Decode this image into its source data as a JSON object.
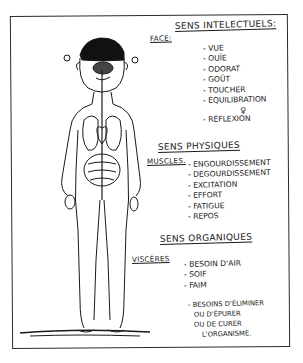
{
  "diagram": {
    "figure": "human-body-outline",
    "sections": [
      {
        "title": "Sens intelectuels:",
        "region_label": "Face:",
        "items": [
          "Vue",
          "Ouïe",
          "Odorat",
          "Goût",
          "Toucher",
          "Équilibration",
          "Réflexion"
        ],
        "symbol": "♀"
      },
      {
        "title": "Sens physiques",
        "region_label": "Muscles.",
        "items": [
          "Engourdissement",
          "Dégourdissement",
          "Excitation",
          "Effort",
          "Fatigue",
          "Repos"
        ]
      },
      {
        "title": "Sens organiques",
        "region_label": "Viscères",
        "items": [
          "Besoin d'air",
          "Soif",
          "Faim"
        ],
        "extra_lines": [
          "- Besoins d'éliminer",
          "ou d'épurer",
          "ou de curer",
          "l'organisme."
        ]
      }
    ],
    "colors": {
      "ink": "#1a1a1a",
      "paper": "#ffffff"
    }
  }
}
